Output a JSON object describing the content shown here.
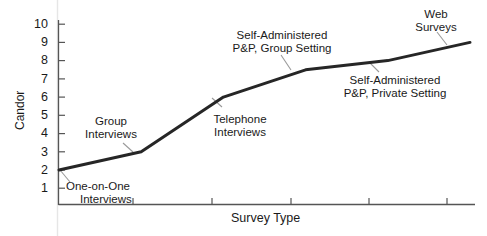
{
  "chart_data": {
    "type": "line",
    "title": "",
    "xlabel": "Survey Type",
    "ylabel": "Candor",
    "ylim": [
      0,
      10
    ],
    "yticks": [
      1,
      2,
      3,
      4,
      5,
      6,
      7,
      8,
      9,
      10
    ],
    "ytick_labels": [
      "1",
      "2",
      "3",
      "4",
      "5",
      "6",
      "7",
      "8",
      "9",
      "10"
    ],
    "xticks_count": 5,
    "xtick_labels": [],
    "grid": false,
    "legend": false,
    "line_color": "#262626",
    "line_width_px": 3,
    "categories": [
      "One-on-One Interviews",
      "Group Interviews",
      "Telephone Interviews",
      "Self-Administered P&P, Group Setting",
      "Self-Administered P&P, Private Setting",
      "Web Surveys"
    ],
    "values": [
      2.0,
      3.0,
      6.0,
      7.5,
      8.0,
      9.0
    ],
    "series": [
      {
        "name": "Candor",
        "points": [
          {
            "label": "One-on-One Interviews",
            "x": 0.0,
            "y": 2.0
          },
          {
            "label": "Group Interviews",
            "x": 1.0,
            "y": 3.0
          },
          {
            "label": "Telephone Interviews",
            "x": 2.0,
            "y": 6.0
          },
          {
            "label": "Self-Administered P&P, Group Setting",
            "x": 3.0,
            "y": 7.5
          },
          {
            "label": "Self-Administered P&P, Private Setting",
            "x": 4.0,
            "y": 8.0
          },
          {
            "label": "Web Surveys",
            "x": 5.0,
            "y": 9.0
          }
        ]
      }
    ],
    "annotations": [
      {
        "id": "one-on-one",
        "lines": [
          "One-on-One",
          "Interviews"
        ],
        "value": 2.0
      },
      {
        "id": "group-interviews",
        "lines": [
          "Group",
          "Interviews"
        ],
        "value": 3.0
      },
      {
        "id": "telephone-interviews",
        "lines": [
          "Telephone",
          "Interviews"
        ],
        "value": 6.0
      },
      {
        "id": "sa-group",
        "lines": [
          "Self-Administered",
          "P&P, Group Setting"
        ],
        "value": 7.5
      },
      {
        "id": "sa-private",
        "lines": [
          "Self-Administered",
          "P&P, Private Setting"
        ],
        "value": 8.0
      },
      {
        "id": "web-surveys",
        "lines": [
          "Web",
          "Surveys"
        ],
        "value": 9.0
      }
    ]
  },
  "axes": {
    "y_title": "Candor",
    "x_title": "Survey Type",
    "y_labels": {
      "t10": "10",
      "t9": "9",
      "t8": "8",
      "t7": "7",
      "t6": "6",
      "t5": "5",
      "t4": "4",
      "t3": "3",
      "t2": "2",
      "t1": "1"
    }
  },
  "annotations": {
    "one_on_one": {
      "line1": "One-on-One",
      "line2": "Interviews"
    },
    "group": {
      "line1": "Group",
      "line2": "Interviews"
    },
    "telephone": {
      "line1": "Telephone",
      "line2": "Interviews"
    },
    "sa_group": {
      "line1": "Self-Administered",
      "line2": "P&P, Group Setting"
    },
    "sa_private": {
      "line1": "Self-Administered",
      "line2": "P&P, Private Setting"
    },
    "web": {
      "line1": "Web",
      "line2": "Surveys"
    }
  },
  "colors": {
    "line": "#262626",
    "axis": "#555555",
    "text": "#1a1a1a",
    "background": "#ffffff",
    "leader": "#8a8a8a",
    "artifact": "#e2e2e2"
  }
}
